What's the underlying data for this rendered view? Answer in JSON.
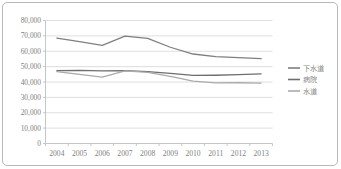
{
  "chart_data": {
    "type": "line",
    "title": "",
    "xlabel": "",
    "ylabel": "",
    "categories": [
      "2004",
      "2005",
      "2006",
      "2007",
      "2008",
      "2009",
      "2010",
      "2011",
      "2012",
      "2013"
    ],
    "ylim": [
      0,
      80000
    ],
    "ytick_values": [
      0,
      10000,
      20000,
      30000,
      40000,
      50000,
      60000,
      70000,
      80000
    ],
    "ytick_labels": [
      "0",
      "10,000",
      "20,000",
      "30,000",
      "40,000",
      "50,000",
      "60,000",
      "70,000",
      "80,000"
    ],
    "grid": true,
    "legend_position": "right",
    "series": [
      {
        "name": "下水道",
        "color": "#7f7f7f",
        "values": [
          68500,
          66200,
          63800,
          69800,
          68400,
          62600,
          58200,
          56500,
          55900,
          55200
        ]
      },
      {
        "name": "病院",
        "color": "#6e6e6e",
        "values": [
          47400,
          47600,
          47200,
          47400,
          46700,
          45600,
          44300,
          44400,
          44800,
          45300
        ]
      },
      {
        "name": "水道",
        "color": "#aaaaaa",
        "values": [
          46800,
          45000,
          43200,
          47200,
          46200,
          43600,
          40600,
          39400,
          39500,
          39300
        ]
      }
    ]
  },
  "axis": {
    "ytick_labels": [
      "80,000",
      "70,000",
      "60,000",
      "50,000",
      "40,000",
      "30,000",
      "20,000",
      "10,000",
      "0"
    ],
    "xtick_labels": [
      "2004",
      "2005",
      "2006",
      "2007",
      "2008",
      "2009",
      "2010",
      "2011",
      "2012",
      "2013"
    ]
  },
  "legend": {
    "items": [
      {
        "label": "下水道",
        "color": "#7f7f7f"
      },
      {
        "label": "病院",
        "color": "#6e6e6e"
      },
      {
        "label": "水道",
        "color": "#aaaaaa"
      }
    ]
  },
  "colors": {
    "frame_border": "#b9b9b9",
    "gridline": "#d6d6d6",
    "axis_line": "#bfbfbf",
    "tick_text": "#808080",
    "background": "#ffffff"
  }
}
